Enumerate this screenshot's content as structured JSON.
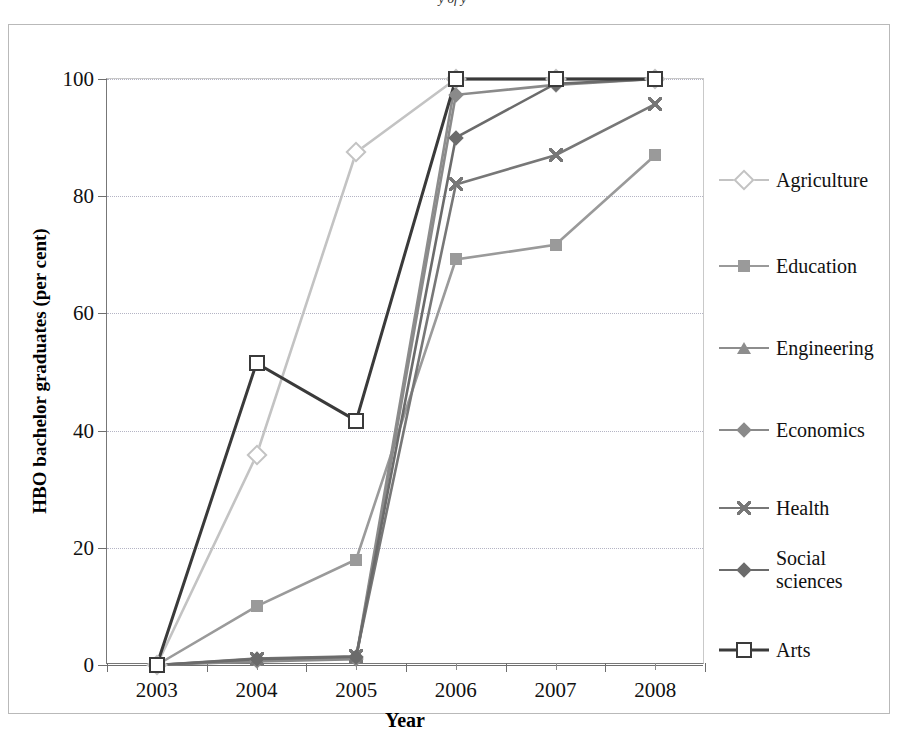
{
  "title_partial": "y  of  y",
  "chart_data": {
    "type": "line",
    "title": "",
    "xlabel": "Year",
    "ylabel": "HBO bachelor graduates  (per cent)",
    "categories": [
      "2003",
      "2004",
      "2005",
      "2006",
      "2007",
      "2008"
    ],
    "x": [
      2003,
      2004,
      2005,
      2006,
      2007,
      2008
    ],
    "ylim": [
      0,
      100
    ],
    "yticks": [
      0,
      20,
      40,
      60,
      80,
      100
    ],
    "grid": true,
    "legend_position": "right",
    "series": [
      {
        "name": "Agriculture",
        "marker": "diamond-open",
        "color": "#c3c3c3",
        "values": [
          0,
          35.8,
          87.5,
          100,
          100,
          100
        ]
      },
      {
        "name": "Education",
        "marker": "square-fill",
        "color": "#9a9a9a",
        "values": [
          0,
          10.0,
          18.0,
          69.2,
          71.7,
          87.0
        ]
      },
      {
        "name": "Engineering",
        "marker": "triangle-fill",
        "color": "#8d8d8d",
        "values": [
          0,
          0.9,
          1.3,
          100,
          100,
          100
        ]
      },
      {
        "name": "Economics",
        "marker": "diamond-fill",
        "color": "#8a8a8a",
        "values": [
          0,
          0.6,
          1.0,
          97.3,
          99.0,
          100
        ]
      },
      {
        "name": "Health",
        "marker": "x-cross",
        "color": "#777777",
        "values": [
          0,
          1.1,
          1.5,
          82.0,
          87.0,
          95.7
        ]
      },
      {
        "name": "Social sciences",
        "marker": "diamond-fill-dark",
        "color": "#6b6b6b",
        "values": [
          0,
          1.0,
          1.4,
          90.0,
          99.2,
          100
        ]
      },
      {
        "name": "Arts",
        "marker": "square-open",
        "color": "#3a3a3a",
        "values": [
          0,
          51.5,
          41.7,
          100,
          100,
          100
        ]
      }
    ]
  },
  "legend": {
    "items": [
      {
        "label": "Agriculture"
      },
      {
        "label": "Education"
      },
      {
        "label": "Engineering"
      },
      {
        "label": "Economics"
      },
      {
        "label": "Health"
      },
      {
        "label": "Social\nsciences"
      },
      {
        "label": "Arts"
      }
    ]
  }
}
